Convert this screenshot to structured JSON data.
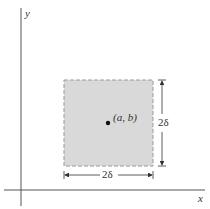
{
  "diagram": {
    "axes": {
      "x_label": "x",
      "y_label": "y"
    },
    "square": {
      "fill": "#d9d9d9",
      "border": "#9a9a9a",
      "border_style": "dashed"
    },
    "point": {
      "label": "(a, b)"
    },
    "dimensions": {
      "width_label": "2δ",
      "height_label": "2δ"
    }
  }
}
